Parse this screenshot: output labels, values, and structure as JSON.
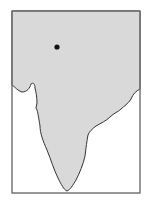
{
  "map": {
    "region": "Indian subcontinent outline",
    "land_color": "#d9d9d9",
    "water_color": "#ffffff",
    "border_color": "#555555",
    "coast_color": "#333333",
    "marker": {
      "label": "",
      "x": 57,
      "y": 47,
      "color": "#111111"
    }
  }
}
